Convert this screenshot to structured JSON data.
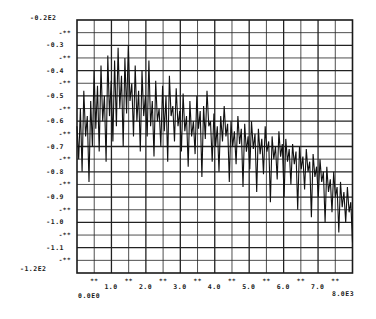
{
  "chart_data": {
    "type": "line",
    "title": "",
    "xlabel": "",
    "ylabel": "",
    "x_range": [
      0,
      8000
    ],
    "y_range": [
      -120,
      -20
    ],
    "x_axis": {
      "min_label": "0.0E0",
      "max_label": "8.0E3",
      "tick_labels": [
        "1.0",
        "2.0",
        "3.0",
        "4.0",
        "5.0",
        "6.0",
        "7.0"
      ],
      "minor_tick_mark": "**"
    },
    "y_axis": {
      "max_label": "-0.2E2",
      "min_label": "-1.2E2",
      "tick_labels": [
        "-0.3",
        "-0.4",
        "-0.5",
        "-0.6",
        "-0.7",
        "-0.8",
        "-0.9",
        "-1.0",
        "-1.1"
      ],
      "minor_tick_mark": "-**"
    },
    "grid": true,
    "legend": null,
    "series": [
      {
        "name": "spectrum",
        "x_step": 50,
        "values": [
          -62,
          -75,
          -55,
          -80,
          -48,
          -66,
          -58,
          -84,
          -52,
          -70,
          -40,
          -63,
          -46,
          -72,
          -38,
          -60,
          -50,
          -76,
          -34,
          -58,
          -44,
          -68,
          -36,
          -62,
          -31,
          -55,
          -42,
          -70,
          -35,
          -57,
          -30,
          -52,
          -45,
          -66,
          -38,
          -60,
          -48,
          -72,
          -40,
          -58,
          -50,
          -66,
          -36,
          -62,
          -52,
          -74,
          -44,
          -60,
          -55,
          -70,
          -46,
          -64,
          -50,
          -76,
          -42,
          -58,
          -54,
          -68,
          -47,
          -62,
          -56,
          -72,
          -49,
          -64,
          -58,
          -78,
          -52,
          -66,
          -60,
          -73,
          -50,
          -63,
          -56,
          -82,
          -54,
          -67,
          -48,
          -62,
          -60,
          -76,
          -57,
          -70,
          -62,
          -80,
          -58,
          -68,
          -54,
          -66,
          -61,
          -84,
          -60,
          -70,
          -64,
          -77,
          -58,
          -69,
          -63,
          -86,
          -61,
          -72,
          -66,
          -79,
          -60,
          -71,
          -65,
          -88,
          -63,
          -73,
          -67,
          -81,
          -62,
          -72,
          -68,
          -92,
          -66,
          -75,
          -70,
          -83,
          -64,
          -74,
          -69,
          -90,
          -67,
          -76,
          -71,
          -85,
          -69,
          -77,
          -72,
          -95,
          -70,
          -79,
          -74,
          -87,
          -71,
          -80,
          -76,
          -98,
          -73,
          -82,
          -78,
          -90,
          -75,
          -84,
          -80,
          -100,
          -78,
          -88,
          -83,
          -96,
          -80,
          -90,
          -86,
          -104,
          -84,
          -94,
          -88,
          -100,
          -86,
          -96,
          -92,
          -108
        ]
      }
    ]
  }
}
